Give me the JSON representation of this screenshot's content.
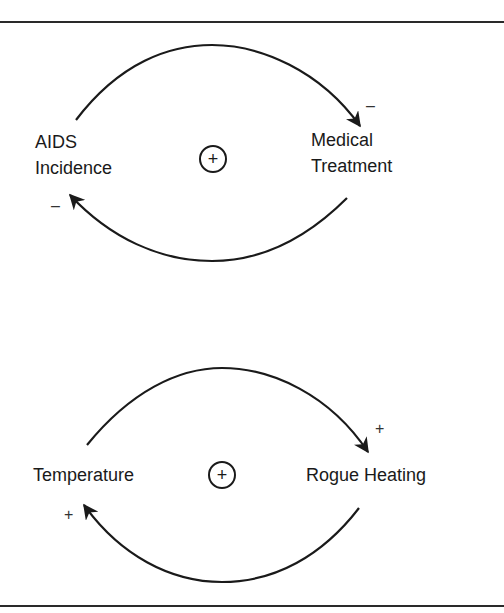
{
  "diagrams": [
    {
      "name": "aids-loop",
      "nodes": [
        {
          "id": "aids_incidence",
          "label_line1": "AIDS",
          "label_line2": "Incidence"
        },
        {
          "id": "medical_treatment",
          "label_line1": "Medical",
          "label_line2": "Treatment"
        }
      ],
      "links": [
        {
          "from": "aids_incidence",
          "to": "medical_treatment",
          "polarity": "–"
        },
        {
          "from": "medical_treatment",
          "to": "aids_incidence",
          "polarity": "–"
        }
      ],
      "loop_polarity": "+"
    },
    {
      "name": "temperature-loop",
      "nodes": [
        {
          "id": "temperature",
          "label": "Temperature"
        },
        {
          "id": "rogue_heating",
          "label": "Rogue Heating"
        }
      ],
      "links": [
        {
          "from": "temperature",
          "to": "rogue_heating",
          "polarity": "+"
        },
        {
          "from": "rogue_heating",
          "to": "temperature",
          "polarity": "+"
        }
      ],
      "loop_polarity": "+"
    }
  ],
  "colors": {
    "line": "#1a1a1a",
    "background": "#ffffff"
  }
}
